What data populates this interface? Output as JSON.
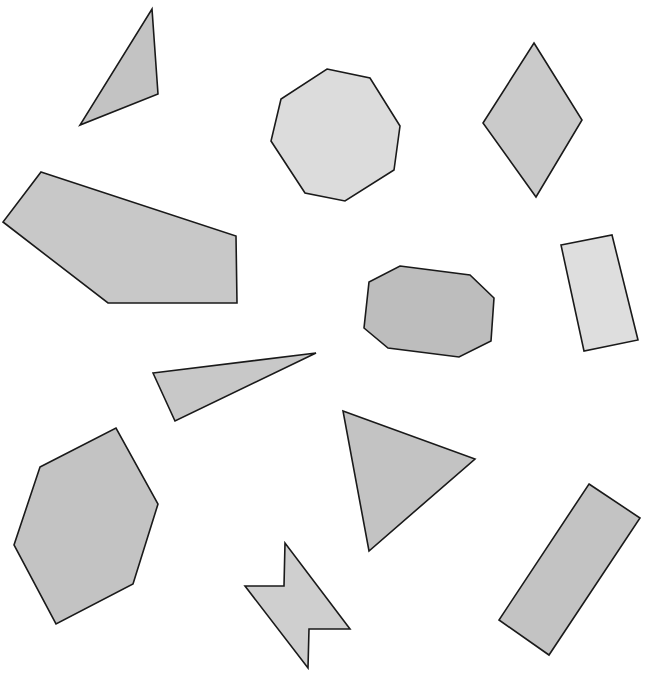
{
  "canvas": {
    "width": 649,
    "height": 679,
    "background": "#ffffff"
  },
  "colors": {
    "stroke": "#1a1a1a",
    "light": "#dedede",
    "medium": "#c8c8c8",
    "dark": "#bdbdbd"
  },
  "shapes": [
    {
      "id": "triangle-top-left",
      "kind": "triangle",
      "fill": "#c3c3c3",
      "points": "152,9 158,94 80,125"
    },
    {
      "id": "pentagon-left",
      "kind": "pentagon",
      "fill": "#c8c8c8",
      "points": "41,172 236,236 237,303 108,303 3,222"
    },
    {
      "id": "octagon-top",
      "kind": "octagon",
      "fill": "#dcdcdc",
      "points": "327,69 370,78 400,126 394,170 345,201 305,193 271,141 281,99"
    },
    {
      "id": "rhombus",
      "kind": "rhombus",
      "fill": "#cacaca",
      "points": "534,43 582,120 536,197 483,123"
    },
    {
      "id": "octagon-middle",
      "kind": "octagon",
      "fill": "#bdbdbd",
      "points": "400,266 470,275 494,298 491,341 459,357 388,348 364,328 369,282"
    },
    {
      "id": "rectangle-right",
      "kind": "rectangle",
      "fill": "#dedede",
      "points": "561,245 612,235 638,340 584,351"
    },
    {
      "id": "triangle-thin",
      "kind": "triangle",
      "fill": "#c8c8c8",
      "points": "153,373 316,353 175,421"
    },
    {
      "id": "hexagon-left",
      "kind": "hexagon",
      "fill": "#c3c3c3",
      "points": "40,467 116,428 158,504 133,584 56,624 14,545"
    },
    {
      "id": "triangle-bottom-middle",
      "kind": "triangle",
      "fill": "#c3c3c3",
      "points": "343,411 475,459 369,551"
    },
    {
      "id": "bowtie-shape",
      "kind": "irregular-polygon",
      "fill": "#cfcfcf",
      "points": "245,586 284,586 285,543 350,629 309,629 308,668"
    },
    {
      "id": "rectangle-bottom-right",
      "kind": "rectangle",
      "fill": "#c3c3c3",
      "points": "589,484 640,518 549,655 499,620"
    }
  ]
}
